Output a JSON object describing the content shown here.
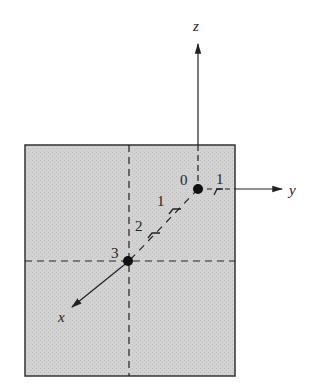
{
  "diagram": {
    "title": "",
    "colors": {
      "plane_fill": "#cfcfcf",
      "plane_border": "#333333",
      "line": "#222222",
      "dash": "#222222"
    },
    "axes": {
      "z": {
        "label": "z"
      },
      "y": {
        "label": "y"
      },
      "x": {
        "label": "x"
      }
    },
    "origin": {
      "label": "0"
    },
    "point3": {
      "label": "3"
    },
    "y_ticks": [
      {
        "label": "1"
      }
    ],
    "x_ticks": [
      {
        "label": "1"
      },
      {
        "label": "2"
      }
    ]
  }
}
